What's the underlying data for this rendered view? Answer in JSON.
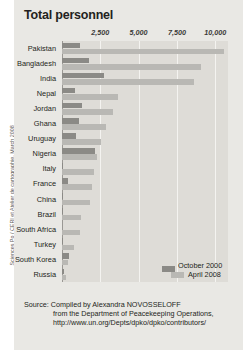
{
  "chart_data": {
    "type": "bar",
    "orientation": "horizontal",
    "title": "Total personnel",
    "xlabel": "",
    "ylabel": "",
    "xlim": [
      0,
      10833
    ],
    "grid": true,
    "legend_position": "bottom-right",
    "tick_labels": [
      "2,500",
      "5,000",
      "7,500",
      "10,000"
    ],
    "tick_values": [
      2500,
      5000,
      7500,
      10000
    ],
    "categories": [
      "Pakistan",
      "Bangladesh",
      "India",
      "Nepal",
      "Jordan",
      "Ghana",
      "Uruguay",
      "Nigeria",
      "Italy",
      "France",
      "China",
      "Brazil",
      "South Africa",
      "Turkey",
      "South Korea",
      "Russia"
    ],
    "series": [
      {
        "name": "October 2000",
        "color": "#8b8a86",
        "values": [
          1150,
          1750,
          2750,
          850,
          1300,
          1100,
          900,
          2150,
          60,
          420,
          90,
          80,
          0,
          60,
          470,
          110
        ]
      },
      {
        "name": "April 2008",
        "color": "#b9b8b4",
        "values": [
          10600,
          9100,
          8600,
          3650,
          3350,
          2900,
          2550,
          2300,
          2100,
          1950,
          1800,
          1250,
          1150,
          800,
          400,
          290
        ]
      }
    ]
  },
  "legend": [
    {
      "label": "October 2000",
      "color": "#8b8a86"
    },
    {
      "label": "April 2008",
      "color": "#b9b8b4"
    }
  ],
  "source": {
    "line1": "Source: Compiled by Alexandra NOVOSSELOFF",
    "line2": "from the Department of Peacekeeping Operations,",
    "line3": "http://www.un.org/Depts/dpko/dpko/contributors/"
  },
  "credit": "Sciences Po / CERI et Atelier de cartographie, March 2008"
}
